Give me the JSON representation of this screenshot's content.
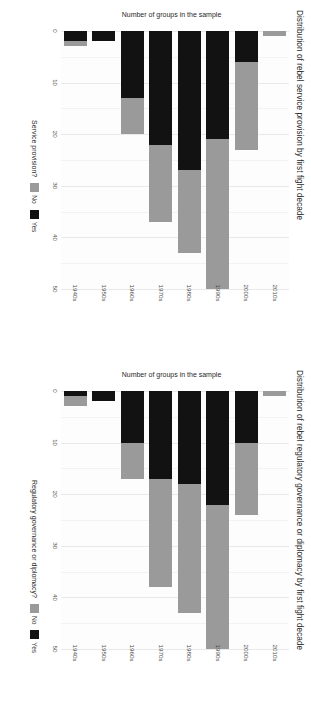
{
  "figure": {
    "orientation": "rotated-90",
    "colors": {
      "yes": "#121212",
      "no": "#9a9a9a",
      "grid": "#e9e9e9",
      "panel_bg": "#fdfdfd"
    }
  },
  "panels": [
    {
      "id": "service-provision",
      "title": "Distribution of rebel service provision by first fight decade",
      "ylabel": "Number of groups in the sample",
      "legend_title": "Service provision?",
      "legend": [
        {
          "key": "no",
          "label": "No"
        },
        {
          "key": "yes",
          "label": "Yes"
        }
      ]
    },
    {
      "id": "regulatory-governance",
      "title": "Distribution of rebel regulatory governance or diplomacy by first fight decade",
      "ylabel": "Number of groups in the sample",
      "legend_title": "Regulatory governance or diplomacy?",
      "legend": [
        {
          "key": "no",
          "label": "No"
        },
        {
          "key": "yes",
          "label": "Yes"
        }
      ]
    }
  ],
  "chart_data": [
    {
      "type": "bar",
      "id": "service-provision",
      "title": "Distribution of rebel service provision by first fight decade",
      "subtitle": "",
      "xlabel": "",
      "ylabel": "Number of groups in the sample",
      "orientation": "vertical-stacked",
      "stacked": true,
      "grid": true,
      "legend_position": "bottom-right",
      "legend_title": "Service provision?",
      "ylim": [
        0,
        50
      ],
      "yticks": [
        0,
        10,
        20,
        30,
        40,
        50
      ],
      "categories": [
        "1940s",
        "1950s",
        "1960s",
        "1970s",
        "1980s",
        "1990s",
        "2000s",
        "2010s"
      ],
      "series": [
        {
          "name": "Yes",
          "color": "#121212",
          "values": [
            2,
            2,
            13,
            22,
            27,
            21,
            6,
            0
          ]
        },
        {
          "name": "No",
          "color": "#9a9a9a",
          "values": [
            1,
            0,
            7,
            15,
            16,
            29,
            17,
            1
          ]
        }
      ],
      "totals": [
        3,
        2,
        20,
        37,
        43,
        50,
        23,
        1
      ]
    },
    {
      "type": "bar",
      "id": "regulatory-governance",
      "title": "Distribution of rebel regulatory governance or diplomacy by first fight decade",
      "subtitle": "",
      "xlabel": "",
      "ylabel": "Number of groups in the sample",
      "orientation": "vertical-stacked",
      "stacked": true,
      "grid": true,
      "legend_position": "bottom-right",
      "legend_title": "Regulatory governance or diplomacy?",
      "ylim": [
        0,
        50
      ],
      "yticks": [
        0,
        10,
        20,
        30,
        40,
        50
      ],
      "categories": [
        "1940s",
        "1950s",
        "1960s",
        "1970s",
        "1980s",
        "1990s",
        "2000s",
        "2010s"
      ],
      "series": [
        {
          "name": "Yes",
          "color": "#121212",
          "values": [
            1,
            2,
            10,
            17,
            18,
            22,
            10,
            0
          ]
        },
        {
          "name": "No",
          "color": "#9a9a9a",
          "values": [
            2,
            0,
            7,
            21,
            25,
            28,
            14,
            1
          ]
        }
      ],
      "totals": [
        3,
        2,
        17,
        38,
        43,
        50,
        24,
        1
      ]
    }
  ]
}
